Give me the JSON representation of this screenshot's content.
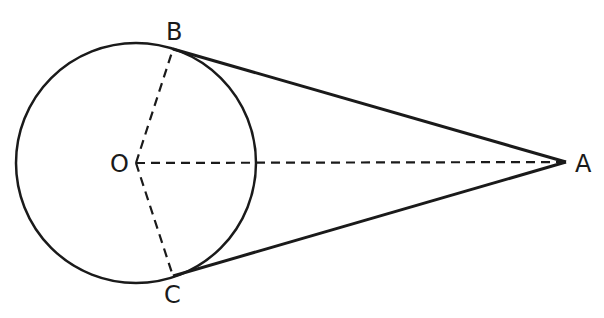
{
  "diagram": {
    "type": "geometry",
    "circle": {
      "center_label": "O",
      "cx": 136,
      "cy": 163,
      "r": 120
    },
    "points": {
      "O": {
        "label": "O",
        "x": 136,
        "y": 163
      },
      "A": {
        "label": "A",
        "x": 566,
        "y": 162
      },
      "B": {
        "label": "B",
        "x": 173,
        "y": 49
      },
      "C": {
        "label": "C",
        "x": 173,
        "y": 276
      }
    },
    "solid_segments": [
      [
        "A",
        "B"
      ],
      [
        "A",
        "C"
      ]
    ],
    "dashed_segments": [
      [
        "O",
        "A"
      ],
      [
        "O",
        "B"
      ],
      [
        "O",
        "C"
      ]
    ],
    "stroke_color": "#1a1a1a"
  }
}
